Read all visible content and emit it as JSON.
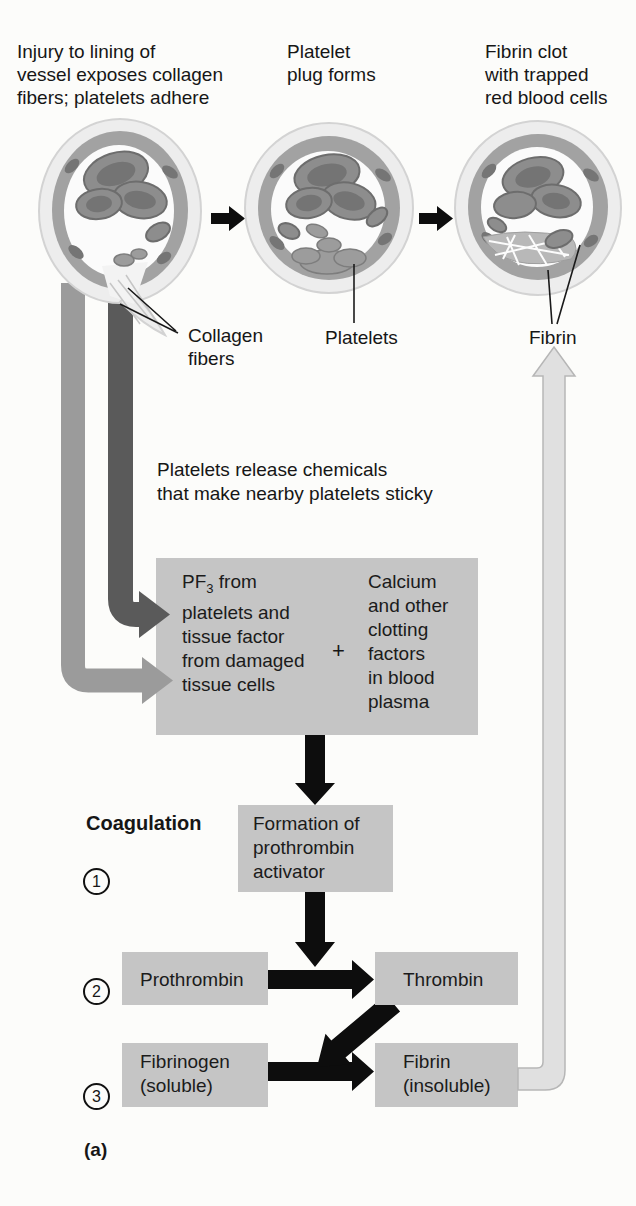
{
  "colors": {
    "box_gray": "#c5c5c5",
    "arrow_dark": "#5a5a5a",
    "arrow_medium": "#9b9b9b",
    "arrow_light_fill": "#e0e0e0",
    "arrow_light_stroke": "#b6b6b6",
    "ink": "#161616"
  },
  "top_row": {
    "labels": [
      {
        "lines": [
          "Injury to lining of",
          "vessel exposes collagen",
          "fibers; platelets adhere"
        ]
      },
      {
        "lines": [
          "Platelet",
          "plug forms"
        ]
      },
      {
        "lines": [
          "Fibrin clot",
          "with trapped",
          "red blood cells"
        ]
      }
    ],
    "callouts": {
      "collagen": {
        "lines": [
          "Collagen",
          "fibers"
        ]
      },
      "platelets": "Platelets",
      "fibrin": "Fibrin"
    }
  },
  "middle": {
    "note": {
      "lines": [
        "Platelets release chemicals",
        "that make nearby platelets sticky"
      ]
    },
    "mix_box": {
      "left": {
        "pf": "PF",
        "pf_sub": "3",
        "pf_rest": " from",
        "lines": [
          "platelets and",
          "tissue factor",
          "from damaged",
          "tissue cells"
        ]
      },
      "plus": "+",
      "right": {
        "lines": [
          "Calcium",
          "and other",
          "clotting",
          "factors",
          "in blood",
          "plasma"
        ]
      }
    }
  },
  "coagulation": {
    "heading": "Coagulation",
    "step1": "1",
    "step2": "2",
    "step3": "3",
    "formation": {
      "lines": [
        "Formation of",
        "prothrombin",
        "activator"
      ]
    },
    "prothrombin": "Prothrombin",
    "thrombin": "Thrombin",
    "fibrinogen": {
      "lines": [
        "Fibrinogen",
        "(soluble)"
      ]
    },
    "fibrin": {
      "lines": [
        "Fibrin",
        "(insoluble)"
      ]
    }
  },
  "figure_label": "(a)"
}
